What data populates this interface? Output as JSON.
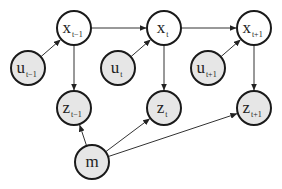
{
  "diagram": {
    "type": "dynamic-bayesian-network",
    "colors": {
      "observed_fill": "#e6e6e6",
      "hidden_fill": "#ffffff",
      "stroke": "#1a1a1a",
      "edge": "#333333"
    },
    "nodes": [
      {
        "id": "x_tm1",
        "base": "x",
        "sub": "t−1",
        "cx": 74,
        "cy": 28,
        "r": 17,
        "shaded": false
      },
      {
        "id": "x_t",
        "base": "x",
        "sub": "t",
        "cx": 164,
        "cy": 28,
        "r": 17,
        "shaded": false
      },
      {
        "id": "x_tp1",
        "base": "x",
        "sub": "t+1",
        "cx": 254,
        "cy": 28,
        "r": 17,
        "shaded": false
      },
      {
        "id": "u_tm1",
        "base": "u",
        "sub": "t−1",
        "cx": 28,
        "cy": 68,
        "r": 17,
        "shaded": true
      },
      {
        "id": "u_t",
        "base": "u",
        "sub": "t",
        "cx": 118,
        "cy": 68,
        "r": 17,
        "shaded": true
      },
      {
        "id": "u_tp1",
        "base": "u",
        "sub": "t+1",
        "cx": 208,
        "cy": 68,
        "r": 17,
        "shaded": true
      },
      {
        "id": "z_tm1",
        "base": "z",
        "sub": "t−1",
        "cx": 74,
        "cy": 108,
        "r": 17,
        "shaded": true
      },
      {
        "id": "z_t",
        "base": "z",
        "sub": "t",
        "cx": 164,
        "cy": 108,
        "r": 17,
        "shaded": true
      },
      {
        "id": "z_tp1",
        "base": "z",
        "sub": "t+1",
        "cx": 254,
        "cy": 108,
        "r": 17,
        "shaded": true
      },
      {
        "id": "m",
        "base": "m",
        "sub": "",
        "cx": 92,
        "cy": 162,
        "r": 17,
        "shaded": true
      }
    ],
    "edges": [
      {
        "from": "x_tm1",
        "to": "x_t"
      },
      {
        "from": "x_t",
        "to": "x_tp1"
      },
      {
        "from": "u_tm1",
        "to": "x_tm1"
      },
      {
        "from": "u_t",
        "to": "x_t"
      },
      {
        "from": "u_tp1",
        "to": "x_tp1"
      },
      {
        "from": "x_tm1",
        "to": "z_tm1"
      },
      {
        "from": "x_t",
        "to": "z_t"
      },
      {
        "from": "x_tp1",
        "to": "z_tp1"
      },
      {
        "from": "m",
        "to": "z_tm1"
      },
      {
        "from": "m",
        "to": "z_t"
      },
      {
        "from": "m",
        "to": "z_tp1"
      }
    ]
  }
}
